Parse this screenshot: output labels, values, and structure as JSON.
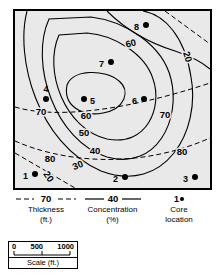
{
  "map": {
    "background_color": "#e9e9e9",
    "border_color": "#000000",
    "core_points": [
      {
        "id": "1",
        "label": "1",
        "x": 20,
        "y": 163,
        "label_x": 13,
        "label_y": 166,
        "label_anchor": "end"
      },
      {
        "id": "2",
        "label": "2",
        "x": 110,
        "y": 166,
        "label_x": 103,
        "label_y": 169,
        "label_anchor": "end"
      },
      {
        "id": "3",
        "label": "3",
        "x": 180,
        "y": 166,
        "label_x": 173,
        "label_y": 169,
        "label_anchor": "end"
      },
      {
        "id": "4",
        "label": "4",
        "x": 31,
        "y": 88,
        "label_x": 31,
        "label_y": 81,
        "label_anchor": "middle"
      },
      {
        "id": "5",
        "label": "5",
        "x": 69,
        "y": 88,
        "label_x": 74,
        "label_y": 91,
        "label_anchor": "start"
      },
      {
        "id": "6",
        "label": "6",
        "x": 129,
        "y": 88,
        "label_x": 122,
        "label_y": 91,
        "label_anchor": "end"
      },
      {
        "id": "7",
        "label": "7",
        "x": 96,
        "y": 51,
        "label_x": 89,
        "label_y": 54,
        "label_anchor": "end"
      },
      {
        "id": "8",
        "label": "8",
        "x": 131,
        "y": 14,
        "label_x": 124,
        "label_y": 17,
        "label_anchor": "end"
      }
    ],
    "concentration_contours": [
      {
        "value": "60",
        "label_x": 71,
        "label_y": 105,
        "rotate": 0
      },
      {
        "value": "50",
        "label_x": 69,
        "label_y": 122,
        "rotate": 0
      },
      {
        "value": "40",
        "label_x": 80,
        "label_y": 140,
        "rotate": 0
      },
      {
        "value": "30",
        "label_x": 63,
        "label_y": 155,
        "rotate": -22
      },
      {
        "value": "60",
        "label_x": 116,
        "label_y": 33,
        "rotate": -14
      }
    ],
    "thickness_contours": [
      {
        "value": "70",
        "label_x": 26,
        "label_y": 101,
        "rotate": 0
      },
      {
        "value": "70",
        "label_x": 150,
        "label_y": 104,
        "rotate": 0
      },
      {
        "value": "80",
        "label_x": 35,
        "label_y": 148,
        "rotate": 0
      },
      {
        "value": "80",
        "label_x": 167,
        "label_y": 141,
        "rotate": 0
      },
      {
        "value": "20",
        "label_x": 172,
        "label_y": 46,
        "rotate": 72
      },
      {
        "value": "20",
        "label_x": 33,
        "label_y": 166,
        "rotate": 55
      }
    ]
  },
  "legend": {
    "thickness": {
      "value": "70",
      "line_style": "dashed",
      "name": "Thickness",
      "unit": "(ft.)"
    },
    "concentration": {
      "value": "40",
      "line_style": "solid",
      "name": "Concentration",
      "unit": "(%)"
    },
    "core": {
      "value": "1",
      "symbol": "filled-circle",
      "name": "Core",
      "unit": "location"
    }
  },
  "scale": {
    "ticks": [
      "0",
      "500",
      "1000"
    ],
    "caption": "Scale (ft.)"
  }
}
